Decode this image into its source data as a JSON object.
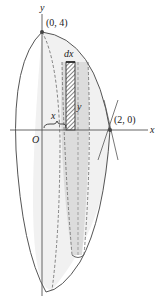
{
  "figure": {
    "type": "solid-of-revolution-shell-method",
    "axis_labels": {
      "x": "x",
      "y": "y"
    },
    "origin_label": "O",
    "points": [
      {
        "label": "(0, 4)",
        "x": 0,
        "y": 4
      },
      {
        "label": "(2, 0)",
        "x": 2,
        "y": 0
      }
    ],
    "shell_labels": {
      "width": "dx",
      "height": "y",
      "radius": "x"
    },
    "colors": {
      "stroke": "#555555",
      "fill_light": "#ececec",
      "fill_mid": "#d6d6d6",
      "hatch": "#333333"
    }
  }
}
